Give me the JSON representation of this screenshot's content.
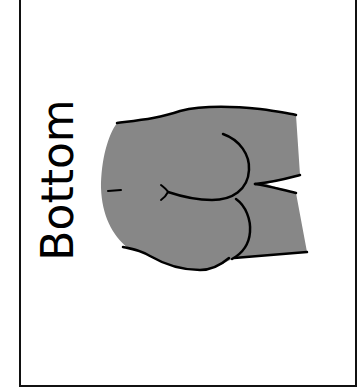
{
  "card": {
    "label": "Bottom",
    "illustration": "buttocks-icon",
    "colors": {
      "border": "#111111",
      "fill": "#878787",
      "outline": "#000000",
      "background": "#ffffff"
    }
  }
}
